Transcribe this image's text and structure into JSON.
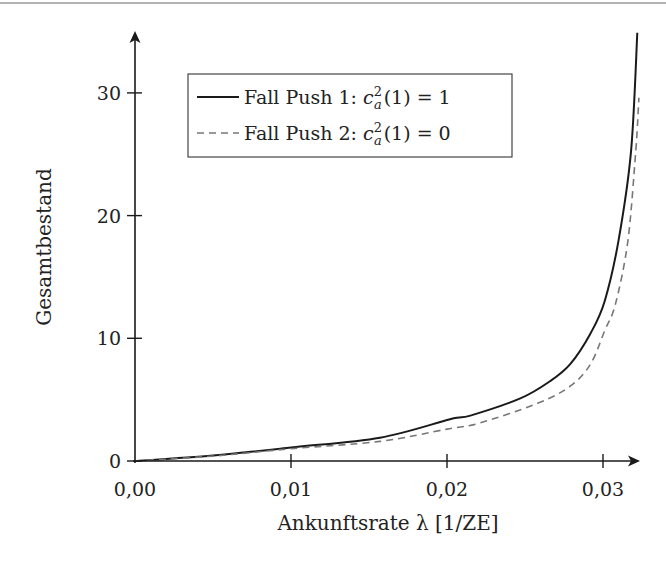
{
  "chart_data": {
    "type": "line",
    "title": "",
    "xlabel": "Ankunftsrate λ [1/ZE]",
    "ylabel": "Gesamtbestand",
    "xlim": [
      0,
      0.0325
    ],
    "ylim": [
      0,
      35
    ],
    "x_ticks": [
      0.0,
      0.01,
      0.02,
      0.03
    ],
    "x_tick_labels": [
      "0,00",
      "0,01",
      "0,02",
      "0,03"
    ],
    "y_ticks": [
      0,
      10,
      20,
      30
    ],
    "y_tick_labels": [
      "0",
      "10",
      "20",
      "30"
    ],
    "grid": false,
    "legend_position": "upper left (inside)",
    "series": [
      {
        "name": "Fall Push 1: c_a^2(1) = 1",
        "style": "solid",
        "color": "#1a1a1a",
        "x": [
          0.0,
          0.005,
          0.01,
          0.0157,
          0.0202,
          0.0215,
          0.0247,
          0.0266,
          0.0279,
          0.0292,
          0.0301,
          0.031,
          0.0318,
          0.0322
        ],
        "y": [
          0.0,
          0.45,
          1.1,
          1.9,
          3.4,
          3.7,
          5.1,
          6.5,
          7.9,
          10.4,
          13.0,
          18.0,
          25.3,
          34.9
        ]
      },
      {
        "name": "Fall Push 2: c_a^2(1) = 0",
        "style": "dashed",
        "color": "#777777",
        "x": [
          0.0,
          0.005,
          0.01,
          0.0157,
          0.02,
          0.0221,
          0.0258,
          0.0279,
          0.0292,
          0.0301,
          0.0308,
          0.0316,
          0.0321,
          0.0323
        ],
        "y": [
          0.0,
          0.4,
          1.0,
          1.6,
          2.6,
          3.1,
          4.7,
          6.1,
          7.9,
          10.6,
          12.8,
          18.0,
          25.3,
          29.6
        ]
      }
    ]
  },
  "legend": {
    "items": [
      {
        "prefix": "Fall Push 1: ",
        "var": "c",
        "sup": "2",
        "sub": "a",
        "suffix": "(1) = 1",
        "style": "solid"
      },
      {
        "prefix": "Fall Push 2: ",
        "var": "c",
        "sup": "2",
        "sub": "a",
        "suffix": "(1) = 0",
        "style": "dashed"
      }
    ]
  },
  "colors": {
    "axis": "#1a1a1a",
    "solid_series": "#1a1a1a",
    "dashed_series": "#777777",
    "top_rule": "#999999"
  }
}
